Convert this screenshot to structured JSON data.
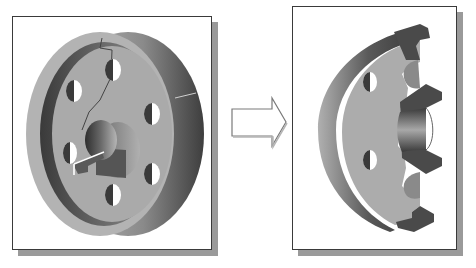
{
  "diagram": {
    "type": "cad-section-view-illustration",
    "panels": [
      {
        "id": "original-part",
        "description": "Isometric view of a solid flange/pulley with a central keyed hub bore and six bolt holes",
        "bolt_hole_count": 6,
        "frame": {
          "x": 12,
          "y": 16,
          "w": 200,
          "h": 234
        }
      },
      {
        "id": "section-view",
        "description": "Half-section cut through the flange exposing the hub and bore profile",
        "visible_bolt_holes": 2,
        "frame": {
          "x": 292,
          "y": 6,
          "w": 165,
          "h": 244
        }
      }
    ],
    "connector": {
      "type": "block-arrow",
      "direction": "right",
      "icon": "arrow-right-icon"
    },
    "colors": {
      "frame_border": "#3a3a3a",
      "shadow": "#9a9a9a",
      "part_face": "#a9a9a9",
      "part_dark": "#4a4a4a",
      "arrow_fill": "#ffffff",
      "arrow_stroke": "#777777"
    }
  }
}
